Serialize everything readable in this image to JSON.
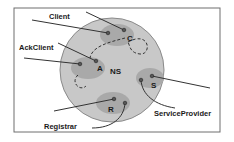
{
  "diagram": {
    "center_label": "NS",
    "regions": [
      {
        "id": "C",
        "letter": "C",
        "name": "Client"
      },
      {
        "id": "A",
        "letter": "A",
        "name": "AckClient"
      },
      {
        "id": "S",
        "letter": "S",
        "name": "ServiceProvider"
      },
      {
        "id": "R",
        "letter": "R",
        "name": "Registrar"
      }
    ],
    "labels": {
      "client": "Client",
      "ackclient": "AckClient",
      "serviceprovider": "ServiceProvider",
      "registrar": "Registrar"
    },
    "colors": {
      "frame": "#6e6e6e",
      "ns_circle": "#c8c8c8",
      "ns_stroke": "#8a8a8a",
      "region": "#a9a9a9",
      "line": "#333333"
    }
  }
}
